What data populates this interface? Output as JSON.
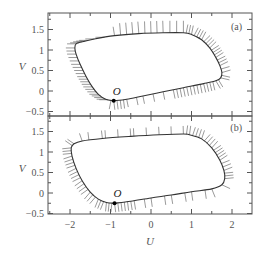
{
  "chart_data": [
    {
      "type": "line",
      "panel_label": "(a)",
      "xlabel": "U",
      "ylabel": "V",
      "xlim": [
        -2.55,
        2.5
      ],
      "ylim": [
        -0.6,
        1.9
      ],
      "xticks": [
        -2,
        -1,
        0,
        1,
        2
      ],
      "yticks": [
        -0.5,
        0,
        0.5,
        1,
        1.5
      ],
      "ytick_labels": [
        "−0.5",
        "0",
        "0.5",
        "1",
        "1.5"
      ],
      "grid": false,
      "point": {
        "label": "O",
        "U": -0.92,
        "V": -0.24
      },
      "limit_cycle": [
        [
          -0.92,
          -0.24
        ],
        [
          -0.6,
          -0.2
        ],
        [
          -0.2,
          -0.12
        ],
        [
          0.3,
          -0.02
        ],
        [
          0.8,
          0.08
        ],
        [
          1.3,
          0.18
        ],
        [
          1.6,
          0.25
        ],
        [
          1.72,
          0.32
        ],
        [
          1.75,
          0.45
        ],
        [
          1.7,
          0.62
        ],
        [
          1.6,
          0.82
        ],
        [
          1.45,
          1.05
        ],
        [
          1.25,
          1.25
        ],
        [
          1.0,
          1.38
        ],
        [
          0.8,
          1.42
        ],
        [
          0.3,
          1.42
        ],
        [
          -0.3,
          1.4
        ],
        [
          -0.9,
          1.35
        ],
        [
          -1.4,
          1.27
        ],
        [
          -1.7,
          1.2
        ],
        [
          -1.85,
          1.15
        ],
        [
          -1.88,
          1.05
        ],
        [
          -1.85,
          0.9
        ],
        [
          -1.75,
          0.65
        ],
        [
          -1.6,
          0.35
        ],
        [
          -1.45,
          0.1
        ],
        [
          -1.3,
          -0.08
        ],
        [
          -1.12,
          -0.2
        ],
        [
          -0.92,
          -0.24
        ]
      ],
      "hatch_description": "short isochron segments crossing the limit cycle; dense near O and along left/right branches"
    },
    {
      "type": "line",
      "panel_label": "(b)",
      "xlabel": "U",
      "ylabel": "V",
      "xlim": [
        -2.55,
        2.5
      ],
      "ylim": [
        -0.5,
        1.9
      ],
      "xticks": [
        -2,
        -1,
        0,
        1,
        2
      ],
      "xtick_labels": [
        "−2",
        "−1",
        "0",
        "1",
        "2"
      ],
      "yticks": [
        -0.5,
        0,
        0.5,
        1,
        1.5
      ],
      "ytick_labels": [
        "−0.5",
        "0",
        "0.5",
        "1",
        "1.5"
      ],
      "grid": false,
      "point": {
        "label": "O",
        "U": -0.9,
        "V": -0.25
      },
      "limit_cycle": [
        [
          -0.9,
          -0.25
        ],
        [
          -0.5,
          -0.2
        ],
        [
          0,
          -0.12
        ],
        [
          0.5,
          -0.05
        ],
        [
          1.0,
          0.03
        ],
        [
          1.5,
          0.1
        ],
        [
          1.75,
          0.2
        ],
        [
          1.82,
          0.35
        ],
        [
          1.8,
          0.55
        ],
        [
          1.7,
          0.8
        ],
        [
          1.5,
          1.1
        ],
        [
          1.25,
          1.32
        ],
        [
          0.95,
          1.42
        ],
        [
          0.8,
          1.44
        ],
        [
          0.2,
          1.42
        ],
        [
          -0.5,
          1.38
        ],
        [
          -1.2,
          1.33
        ],
        [
          -1.7,
          1.27
        ],
        [
          -1.9,
          1.2
        ],
        [
          -1.97,
          1.1
        ],
        [
          -1.95,
          0.9
        ],
        [
          -1.85,
          0.6
        ],
        [
          -1.7,
          0.3
        ],
        [
          -1.5,
          0.02
        ],
        [
          -1.3,
          -0.15
        ],
        [
          -1.1,
          -0.23
        ],
        [
          -0.9,
          -0.25
        ]
      ],
      "hatch_description": "short isochron segments; dense along left-bottom branch and upper-right branch, sparse on top and bottom"
    }
  ],
  "layout": {
    "frame": {
      "left": 48,
      "right": 252
    },
    "x_origin_px": 151,
    "x_px_per_unit": 40.5,
    "panels": [
      {
        "top": 13,
        "bottom": 116,
        "y_zero_px": 91,
        "y_px_per_unit": 41
      },
      {
        "top": 116,
        "bottom": 214,
        "y_zero_px": 193,
        "y_px_per_unit": 41
      }
    ]
  },
  "colors": {
    "axis": "#555555",
    "curve": "#333333",
    "hatch": "#555555",
    "point": "#000000"
  }
}
